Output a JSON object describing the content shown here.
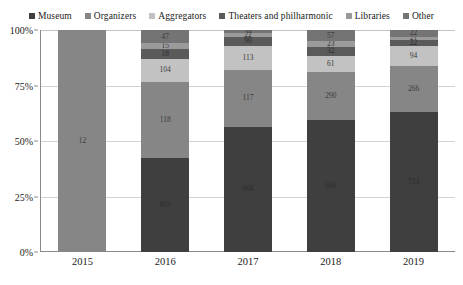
{
  "chart_data": {
    "type": "bar",
    "subtype": "100% stacked column",
    "title": "",
    "xlabel": "",
    "ylabel": "",
    "categories": [
      "2015",
      "2016",
      "2017",
      "2018",
      "2019"
    ],
    "ylim": [
      0,
      100
    ],
    "ytick_labels": [
      "0%",
      "25%",
      "50%",
      "75%",
      "100%"
    ],
    "ytick_values": [
      0,
      25,
      50,
      75,
      100
    ],
    "grid": true,
    "legend_position": "top",
    "stack_order_bottom_to_top": [
      "Museum",
      "Organizers",
      "Aggregators",
      "Theaters and philharmonic",
      "Libraries",
      "Other"
    ],
    "series": [
      {
        "name": "Museum",
        "color": "#3f3f3f",
        "values": [
          null,
          603,
          666,
          610,
          713
        ],
        "labels": [
          "",
          "603",
          "666",
          "610",
          "713"
        ],
        "percents": [
          0,
          42.5,
          56.5,
          59.5,
          63.0
        ]
      },
      {
        "name": "Organizers",
        "color": "#868686",
        "values": [
          12,
          118,
          117,
          290,
          266
        ],
        "labels": [
          "12",
          "118",
          "117",
          "290",
          "266"
        ],
        "percents": [
          100,
          34.0,
          25.5,
          21.5,
          21.0
        ]
      },
      {
        "name": "Aggregators",
        "color": "#c2c2c2",
        "values": [
          null,
          104,
          113,
          61,
          94
        ],
        "labels": [
          "",
          "104",
          "113",
          "61",
          "94"
        ],
        "percents": [
          0,
          10.5,
          11.0,
          7.5,
          9.0
        ]
      },
      {
        "name": "Theaters and philharmonic",
        "color": "#5a5a5a",
        "values": [
          null,
          18,
          90,
          32,
          22
        ],
        "labels": [
          "",
          "18",
          "90",
          "32",
          "22"
        ],
        "percents": [
          0,
          4.5,
          4.0,
          4.0,
          2.5
        ]
      },
      {
        "name": "Libraries",
        "color": "#9a9a9a",
        "values": [
          null,
          15,
          22,
          23,
          21
        ],
        "labels": [
          "",
          "15",
          "22",
          "23",
          "21"
        ],
        "percents": [
          0,
          2.5,
          1.5,
          2.5,
          1.5
        ]
      },
      {
        "name": "Other",
        "color": "#747474",
        "values": [
          null,
          47,
          34,
          57,
          22
        ],
        "labels": [
          "",
          "47",
          "34",
          "57",
          "22"
        ],
        "percents": [
          0,
          6.0,
          1.5,
          5.0,
          3.0
        ]
      }
    ]
  },
  "legend": {
    "items": [
      {
        "label": "Museum",
        "color": "#3f3f3f"
      },
      {
        "label": "Organizers",
        "color": "#868686"
      },
      {
        "label": "Aggregators",
        "color": "#c2c2c2"
      },
      {
        "label": "Theaters and philharmonic",
        "color": "#5a5a5a"
      },
      {
        "label": "Libraries",
        "color": "#9a9a9a"
      },
      {
        "label": "Other",
        "color": "#747474"
      }
    ]
  },
  "axes": {
    "y_ticks": [
      "100%",
      "75%",
      "50%",
      "25%",
      "0%"
    ],
    "x_ticks": [
      "2015",
      "2016",
      "2017",
      "2018",
      "2019"
    ]
  },
  "colors": {
    "axis": "#8a8a8a",
    "grid": "#d2d2d2",
    "text": "#1a1a1a",
    "background": "#ffffff"
  }
}
